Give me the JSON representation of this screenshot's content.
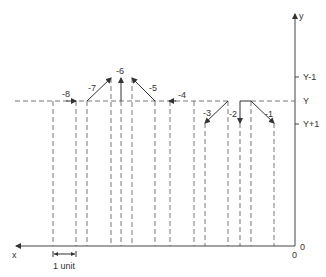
{
  "diagram": {
    "axes": {
      "x_label": "x",
      "y_label": "y",
      "origin_x_label": "0",
      "origin_y_label": "0",
      "y_ticks": [
        {
          "label": "Y-1",
          "y": 77
        },
        {
          "label": "Y",
          "y": 101
        },
        {
          "label": "Y+1",
          "y": 124
        }
      ]
    },
    "scale_bar": {
      "label": "1 unit"
    },
    "vertical_lines_x": [
      53,
      76,
      87,
      111,
      121,
      132,
      155,
      170,
      194,
      205,
      228,
      240,
      251,
      274
    ],
    "arrows": [
      {
        "label": "-8",
        "from": [
          60,
          101
        ],
        "to": [
          76,
          101
        ],
        "label_pos": [
          62,
          96
        ]
      },
      {
        "label": "-7",
        "from": [
          87,
          101
        ],
        "to": [
          111,
          78
        ],
        "label_pos": [
          88,
          92
        ]
      },
      {
        "label": "-6",
        "from": [
          121,
          101
        ],
        "to": [
          121,
          78
        ],
        "label_pos": [
          117,
          74
        ]
      },
      {
        "label": "-5",
        "from": [
          155,
          101
        ],
        "to": [
          132,
          78
        ],
        "label_pos": [
          148,
          90
        ]
      },
      {
        "label": "-4",
        "from": [
          186,
          101
        ],
        "to": [
          170,
          101
        ],
        "label_pos": [
          178,
          97
        ]
      },
      {
        "label": "-3",
        "from": [
          228,
          101
        ],
        "to": [
          205,
          123
        ],
        "label_pos": [
          203,
          116
        ]
      },
      {
        "label": "-2",
        "from": [
          240,
          101
        ],
        "to": [
          240,
          123
        ],
        "label_pos": [
          230,
          117
        ]
      },
      {
        "label": "-1",
        "from": [
          251,
          101
        ],
        "to": [
          274,
          123
        ],
        "label_pos": [
          264,
          117
        ]
      }
    ]
  }
}
